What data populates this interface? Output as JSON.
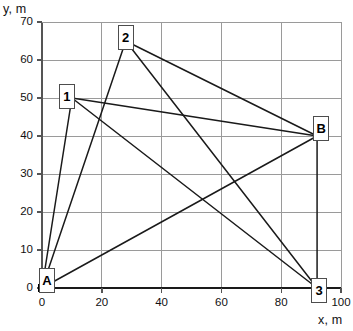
{
  "chart_data": {
    "type": "scatter",
    "title": "",
    "subtitle": "",
    "xlabel": "x, m",
    "ylabel": "y, m",
    "xlim": [
      0,
      100
    ],
    "ylim": [
      0,
      70
    ],
    "xticks": [
      0,
      20,
      40,
      60,
      80,
      100
    ],
    "yticks": [
      0,
      10,
      20,
      30,
      40,
      50,
      60,
      70
    ],
    "xtick_labels": [
      "0",
      "20",
      "40",
      "60",
      "80",
      "100"
    ],
    "ytick_labels": [
      "0",
      "10",
      "20",
      "30",
      "40",
      "50",
      "60",
      "70"
    ],
    "grid": true,
    "legend": "none",
    "nodes": [
      {
        "id": "A",
        "label": "A",
        "x": 0,
        "y": 0,
        "marker": "filled-square",
        "label_dx": 5,
        "label_dy": 8
      },
      {
        "id": "B",
        "label": "B",
        "x": 92,
        "y": 40,
        "marker": "filled-square",
        "label_dx": 4,
        "label_dy": 8
      },
      {
        "id": "1",
        "label": "1",
        "x": 10,
        "y": 50,
        "marker": "none",
        "label_dx": -5,
        "label_dy": 2
      },
      {
        "id": "2",
        "label": "2",
        "x": 28,
        "y": 65,
        "marker": "none",
        "label_dx": 0,
        "label_dy": 4
      },
      {
        "id": "3",
        "label": "3",
        "x": 92,
        "y": 0,
        "marker": "none",
        "label_dx": 2,
        "label_dy": -2
      }
    ],
    "edges": [
      {
        "from": "A",
        "to": "1"
      },
      {
        "from": "A",
        "to": "2"
      },
      {
        "from": "A",
        "to": "B"
      },
      {
        "from": "1",
        "to": "B"
      },
      {
        "from": "1",
        "to": "3"
      },
      {
        "from": "2",
        "to": "B"
      },
      {
        "from": "2",
        "to": "3"
      },
      {
        "from": "B",
        "to": "3"
      }
    ],
    "colors": {
      "line": "#1a1a1a",
      "grid": "#9a9a9a",
      "axis": "#555555",
      "marker": "#000000",
      "node_box_border": "#4d4d4d",
      "node_box_fill": "#ffffff",
      "background": "#ffffff"
    }
  }
}
